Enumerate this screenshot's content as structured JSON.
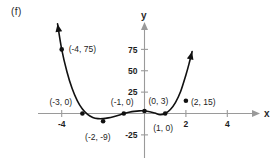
{
  "figure": {
    "panel_label": "(f)",
    "axis_x_name": "x",
    "axis_y_name": "y"
  },
  "chart_data": {
    "type": "line",
    "title": "",
    "xlabel": "x",
    "ylabel": "y",
    "xlim": [
      -4.6,
      5.2
    ],
    "ylim": [
      -32,
      92
    ],
    "grid": false,
    "legend": null,
    "x_ticks": [
      -4,
      2,
      4
    ],
    "x_tick_labels": [
      "-4",
      "2",
      "4"
    ],
    "y_ticks": [
      75,
      50,
      25,
      -25
    ],
    "y_tick_labels": [
      "75",
      "50",
      "25",
      "-25"
    ],
    "curve_description": "quartic polynomial with roots at x = -3, -1, 1 and y-intercept 3",
    "x": [
      -4.2,
      -4.0,
      -3.75,
      -3.5,
      -3.25,
      -3.0,
      -2.75,
      -2.5,
      -2.25,
      -2.0,
      -1.75,
      -1.5,
      -1.25,
      -1.0,
      -0.75,
      -0.5,
      -0.25,
      0.0,
      0.25,
      0.5,
      0.75,
      1.0,
      1.25,
      1.5,
      1.75,
      2.0,
      2.15,
      2.3
    ],
    "y": [
      104.8,
      75.0,
      49.2,
      29.5,
      15.1,
      5.2,
      -1.1,
      -4.6,
      -6.0,
      -6.0,
      -5.1,
      -3.7,
      -2.0,
      0.0,
      1.4,
      2.5,
      3.1,
      3.0,
      2.1,
      0.5,
      -1.4,
      0.0,
      4.7,
      13.1,
      26.0,
      45.0,
      58.0,
      72.5
    ],
    "annotations": [
      {
        "label": "(-4, 75)",
        "x": -4.0,
        "y": 75,
        "marker": true,
        "label_dx": 7,
        "label_dy": 3
      },
      {
        "label": "(-3, 0)",
        "x": -3.0,
        "y": 0,
        "marker": true,
        "label_dx": -33,
        "label_dy": -9
      },
      {
        "label": "(-2, -9)",
        "x": -2.0,
        "y": -9,
        "marker": true,
        "label_dx": -18,
        "label_dy": 19
      },
      {
        "label": "(-1, 0)",
        "x": -1.0,
        "y": 0,
        "marker": true,
        "label_dx": -13,
        "label_dy": -9
      },
      {
        "label": "(0, 3)",
        "x": 0.0,
        "y": 3,
        "marker": true,
        "label_dx": 4,
        "label_dy": -7
      },
      {
        "label": "(1, 0)",
        "x": 1.0,
        "y": 0,
        "marker": true,
        "label_dx": -12,
        "label_dy": 17
      },
      {
        "label": "(2, 15)",
        "x": 2.0,
        "y": 15,
        "marker": true,
        "label_dx": 5,
        "label_dy": 4
      }
    ],
    "arrows": [
      "left-branch-up",
      "right-branch-up"
    ],
    "colors": {
      "curve": "#111111",
      "axis": "#9a9a9a",
      "text": "#1d1d1d",
      "background": "#ffffff"
    }
  }
}
